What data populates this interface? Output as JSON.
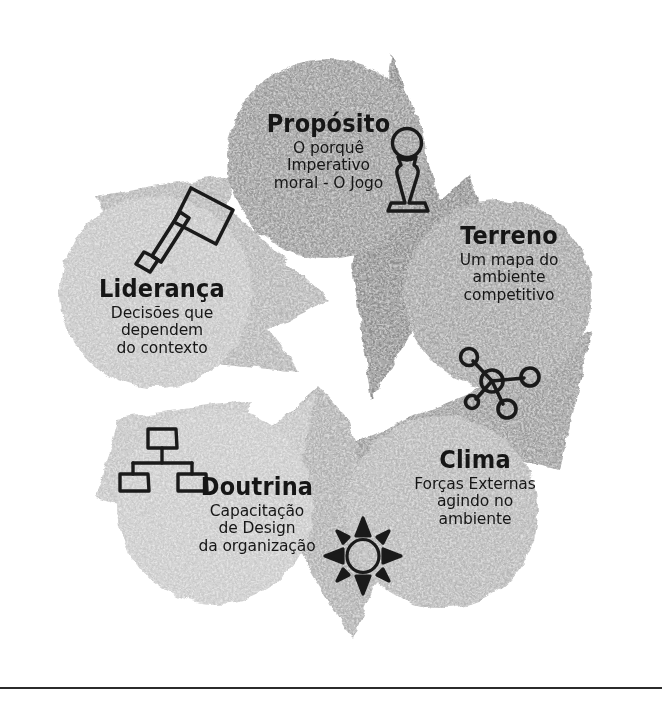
{
  "diagram": {
    "type": "cycle",
    "direction": "clockwise",
    "node_count": 5,
    "style": "hand-drawn brush strokes",
    "colors": {
      "background": "#ffffff",
      "circle_dark": "#9a9a9a",
      "circle_light": "#c6c6c6",
      "circle_mid": "#b4b4b4",
      "arrow_dark": "#8f8f8f",
      "arrow_light": "#c0c0c0",
      "text": "#161616",
      "divider": "#2b2b2b"
    },
    "nodes": [
      {
        "id": "proposito",
        "title": "Propósito",
        "desc_lines": [
          "O porquê",
          "Imperativo",
          "moral - O Jogo"
        ],
        "icon": "chess-pawn-icon",
        "shade": "#9a9a9a"
      },
      {
        "id": "terreno",
        "title": "Terreno",
        "desc_lines": [
          "Um mapa do",
          "ambiente",
          "competitivo"
        ],
        "icon": "network-nodes-icon",
        "shade": "#a6a6a6"
      },
      {
        "id": "clima",
        "title": "Clima",
        "desc_lines": [
          "Forças Externas",
          "agindo no",
          "ambiente"
        ],
        "icon": "compass-rose-icon",
        "shade": "#b8b8b8"
      },
      {
        "id": "doutrina",
        "title": "Doutrina",
        "desc_lines": [
          "Capacitação",
          "de Design",
          "da organização"
        ],
        "icon": "org-chart-icon",
        "shade": "#cacaca"
      },
      {
        "id": "lideranca",
        "title": "Liderança",
        "desc_lines": [
          "Decisões que",
          "dependem",
          "do contexto"
        ],
        "icon": "gavel-icon",
        "shade": "#c6c6c6"
      }
    ],
    "arrows": [
      {
        "from": "proposito",
        "to": "terreno",
        "shade": "#8f8f8f"
      },
      {
        "from": "terreno",
        "to": "clima",
        "shade": "#9c9c9c"
      },
      {
        "from": "clima",
        "to": "doutrina",
        "shade": "#b0b0b0"
      },
      {
        "from": "doutrina",
        "to": "lideranca",
        "shade": "#c4c4c4"
      },
      {
        "from": "lideranca",
        "to": "proposito",
        "shade": "#b6b6b6"
      }
    ]
  }
}
